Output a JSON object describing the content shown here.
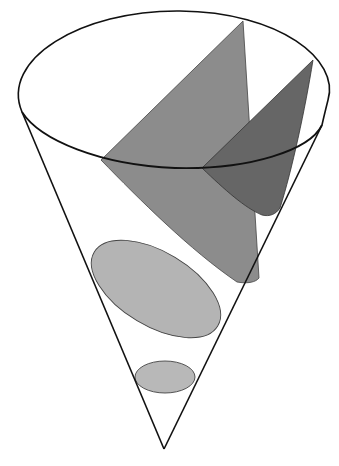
{
  "diagram": {
    "colors": {
      "background": "#ffffff",
      "outline": "#111111",
      "hyperbola_fill": "#8c8c8c",
      "parabola_fill": "#666666",
      "ellipse_fill": "#b4b4b4",
      "circle_fill": "#b8b8b8",
      "section_stroke": "#444444"
    },
    "cone": {
      "apex": [
        164,
        449
      ],
      "rim_center": [
        172,
        96
      ],
      "rim_rx": 157,
      "rim_ry": 86,
      "left_tangent": [
        22,
        112
      ],
      "right_tangent": [
        322,
        125
      ]
    },
    "sections": [
      {
        "name": "hyperbola",
        "shape": "plane cut parallel to axis"
      },
      {
        "name": "parabola",
        "shape": "plane cut parallel to side"
      },
      {
        "name": "ellipse",
        "center": [
          157,
          290
        ],
        "rx": 70,
        "ry": 37,
        "rotation": 32
      },
      {
        "name": "circle",
        "center": [
          165,
          377
        ],
        "rx": 30,
        "ry": 16,
        "rotation": 0
      }
    ]
  }
}
